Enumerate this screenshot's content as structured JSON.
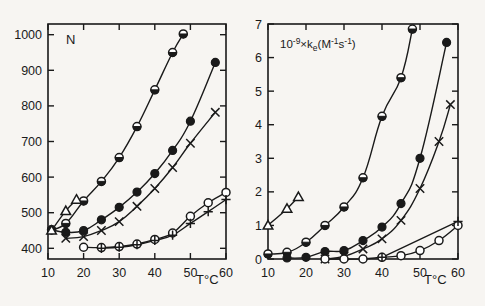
{
  "figure": {
    "background_color": "#f7f5f2",
    "ink_color": "#1a1a1a",
    "panel_count": 2
  },
  "chart_data": [
    {
      "type": "scatter",
      "panel": "left",
      "title": "",
      "xlabel": "T°C",
      "ylabel": "N",
      "xlim": [
        10,
        60
      ],
      "ylim": [
        370,
        1030
      ],
      "xticks": [
        10,
        20,
        30,
        40,
        50,
        60
      ],
      "xtick_labels": [
        "10",
        "20",
        "30",
        "40",
        "50",
        "60"
      ],
      "yticks": [
        400,
        500,
        600,
        700,
        800,
        900,
        1000
      ],
      "ytick_labels": [
        "400",
        "500",
        "600",
        "700",
        "800",
        "900",
        "1000"
      ],
      "grid": false,
      "legend": "none",
      "series": [
        {
          "name": "half-filled-circle",
          "marker": "half-circle",
          "x": [
            11,
            15,
            20,
            25,
            30,
            35,
            40,
            45,
            48
          ],
          "y": [
            452,
            470,
            533,
            588,
            655,
            742,
            845,
            950,
            1002
          ]
        },
        {
          "name": "filled-circle",
          "marker": "filled-circle",
          "x": [
            11,
            15,
            20,
            25,
            30,
            35,
            40,
            45,
            50,
            57
          ],
          "y": [
            452,
            445,
            450,
            480,
            515,
            558,
            610,
            675,
            757,
            922
          ]
        },
        {
          "name": "cross",
          "marker": "cross",
          "x": [
            15,
            20,
            25,
            30,
            35,
            40,
            45,
            50,
            57
          ],
          "y": [
            428,
            433,
            450,
            475,
            518,
            568,
            627,
            695,
            782
          ]
        },
        {
          "name": "open-circle",
          "marker": "open-circle",
          "x": [
            20,
            25,
            30,
            35,
            40,
            45,
            50,
            55,
            60
          ],
          "y": [
            403,
            402,
            405,
            412,
            425,
            443,
            490,
            528,
            557
          ]
        },
        {
          "name": "plus",
          "marker": "plus",
          "x": [
            25,
            30,
            35,
            40,
            45,
            50,
            55,
            60
          ],
          "y": [
            400,
            403,
            410,
            422,
            437,
            470,
            503,
            537
          ]
        },
        {
          "name": "open-triangle",
          "marker": "open-triangle",
          "x": [
            11,
            15,
            18
          ],
          "y": [
            450,
            505,
            537
          ]
        }
      ]
    },
    {
      "type": "scatter",
      "panel": "right",
      "title": "",
      "xlabel": "T°C",
      "ylabel": "10⁻⁹ × kₑ (M⁻¹s⁻¹)",
      "ylabel_parts": {
        "prefix": "10",
        "prefix_exponent": "-9",
        "times": "×",
        "symbol": "k",
        "subscript": "e",
        "units": "(M",
        "unit_exp1": "-1",
        "unit_sym2": "s",
        "unit_exp2": "-1",
        "units_close": ")"
      },
      "xlim": [
        10,
        60
      ],
      "ylim": [
        0,
        7
      ],
      "xticks": [
        10,
        20,
        30,
        40,
        50,
        60
      ],
      "xtick_labels": [
        "10",
        "20",
        "30",
        "40",
        "50",
        "60"
      ],
      "yticks": [
        0,
        1,
        2,
        3,
        4,
        5,
        6,
        7
      ],
      "ytick_labels": [
        "0",
        "1",
        "2",
        "3",
        "4",
        "5",
        "6",
        "7"
      ],
      "grid": false,
      "legend": "none",
      "series": [
        {
          "name": "half-filled-circle",
          "marker": "half-circle",
          "x": [
            10,
            15,
            20,
            25,
            30,
            35,
            40,
            45,
            48
          ],
          "y": [
            0.15,
            0.2,
            0.5,
            1.0,
            1.55,
            2.42,
            4.25,
            5.4,
            6.85
          ]
        },
        {
          "name": "filled-circle",
          "marker": "filled-circle",
          "x": [
            15,
            20,
            25,
            30,
            35,
            40,
            45,
            50,
            57
          ],
          "y": [
            0.03,
            0.05,
            0.22,
            0.25,
            0.55,
            0.95,
            1.65,
            3.0,
            6.45
          ]
        },
        {
          "name": "cross",
          "marker": "cross",
          "x": [
            25,
            30,
            35,
            40,
            45,
            50,
            55,
            58
          ],
          "y": [
            0.0,
            0.08,
            0.3,
            0.6,
            1.15,
            2.1,
            3.5,
            4.6
          ]
        },
        {
          "name": "open-circle",
          "marker": "open-circle",
          "x": [
            25,
            30,
            35,
            40,
            45,
            50,
            55,
            60
          ],
          "y": [
            0.0,
            0.0,
            0.0,
            0.05,
            0.1,
            0.25,
            0.55,
            1.0
          ]
        },
        {
          "name": "plus",
          "marker": "plus",
          "x": [
            40,
            60
          ],
          "y": [
            0.05,
            1.12
          ]
        },
        {
          "name": "open-triangle",
          "marker": "open-triangle",
          "x": [
            10,
            15,
            18
          ],
          "y": [
            1.0,
            1.5,
            1.85
          ]
        }
      ]
    }
  ],
  "left_panel": {
    "y_axis_label": "N",
    "x_axis_label": "T°C",
    "x_tick_labels": [
      "10",
      "20",
      "30",
      "40",
      "50",
      "60"
    ],
    "y_tick_labels": [
      "400",
      "500",
      "600",
      "700",
      "800",
      "900",
      "1000"
    ]
  },
  "right_panel": {
    "x_axis_label": "T°C",
    "x_tick_labels": [
      "10",
      "20",
      "30",
      "40",
      "50",
      "60"
    ],
    "y_tick_labels": [
      "0",
      "1",
      "2",
      "3",
      "4",
      "5",
      "6",
      "7"
    ]
  }
}
